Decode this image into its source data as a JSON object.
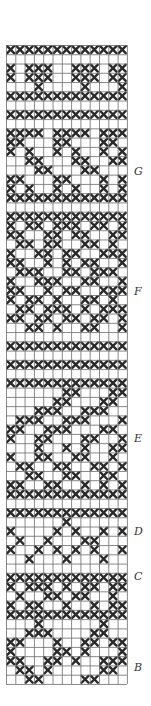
{
  "figure": {
    "grid": {
      "cols": 13,
      "rows": 69,
      "cell_w": 9.3,
      "cell_h": 9.26,
      "line_color": "#6a6a6a",
      "stitch_color": "#2a2a2a"
    },
    "labels": [
      {
        "text": "G",
        "y": 165
      },
      {
        "text": "F",
        "y": 285
      },
      {
        "text": "E",
        "y": 432
      },
      {
        "text": "D",
        "y": 525
      },
      {
        "text": "C",
        "y": 570
      },
      {
        "text": "B",
        "y": 661
      }
    ],
    "rows": [
      "xxxxxxxxxxxxx",
      ".............",
      "x.xxx..xxx.xx",
      "x.xxx..xxx.xx",
      "...x....x...x",
      "xxxxxxxxxxxxx",
      ".............",
      "xxxxxxxxxxxxx",
      ".............",
      "xxxx.xxxx.xxx",
      "xx...xx...xx.",
      "x.x..x.x..x.x",
      "..xx...xx..xx",
      "...xx...xx...",
      "xx...xx...x.x",
      "x.x..x.x..x.x",
      "xxxxxxxxxxxxx",
      ".............",
      "xxxxxxxxxxxxx",
      "x.xx.xxx.xx.x",
      "xx..xx.xx..xx",
      ".xx.xx..xx.x.",
      "x..xx.xx..xxx",
      "xx..x.x.xx..x",
      ".xxx..xx.xxx.",
      "x..xxx..xx..x",
      "xx..x.xx..xxx",
      "x.xx.x..xx.x.",
      ".xx.xxx.x.xxx",
      "xx.xx.xx.xx.x",
      "..xx.x..xx..x",
      ".............",
      "xxxxxxxxxxxxx",
      ".............",
      "xxxxxxxxxxxxx",
      ".............",
      "xxxxxxxxxxxxx",
      "......xx...xx",
      ".....xx...xx.",
      "...xxx..xxx..",
      ".xxx..xxx...x",
      "xx..xxx...xx.",
      "x..xx...xx..x",
      "...x..x.x..xx",
      "x..xx..xx..x.",
      ".xx..xx..xx.x",
      "..xx..xx..xx.",
      "xx..xx..x.x.x",
      "xxxxxxxxxxxxx",
      ".............",
      "xxxxxxxxxxxxx",
      "......x......",
      "x....x.x..x.x",
      ".x..x...xx...",
      "x..x.x.x.x..x",
      "..x...x...x..",
      ".............",
      "xxxxxxxxxxxxx",
      "x.xxx.x.xx.xx",
      ".x..xx.xx..x.",
      "x.xx..x..x.xx",
      "xxxxxxxxxxxxx",
      "...x......x..",
      "..xxx....xx..",
      "xx...x..xx.xx",
      "x....xx.x...x",
      "xx..xx.x..xxx",
      ".xx.x.....xx.",
      "..xx....xx..."
    ]
  }
}
